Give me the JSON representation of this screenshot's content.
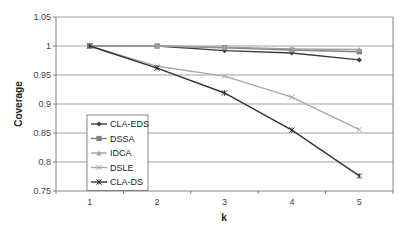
{
  "chart_data": {
    "type": "line",
    "title": "",
    "xlabel": "k",
    "ylabel": "Coverage",
    "categories": [
      "1",
      "2",
      "3",
      "4",
      "5"
    ],
    "x": [
      1,
      2,
      3,
      4,
      5
    ],
    "ylim": [
      0.75,
      1.05
    ],
    "yticks": [
      0.75,
      0.8,
      0.85,
      0.9,
      0.95,
      1,
      1.05
    ],
    "ytick_labels": [
      "0.75",
      "0.8",
      "0.85",
      "0.9",
      "0.95",
      "1",
      "1.05"
    ],
    "grid": true,
    "legend_position": "bottom-left",
    "series": [
      {
        "name": "CLA-EDS",
        "marker": "diamond",
        "color": "#3c3c3c",
        "values": [
          1.0,
          1.0,
          0.992,
          0.988,
          0.976
        ]
      },
      {
        "name": "DSSA",
        "marker": "square",
        "color": "#808080",
        "values": [
          1.0,
          1.0,
          0.997,
          0.993,
          0.99
        ]
      },
      {
        "name": "IDCA",
        "marker": "triangle",
        "color": "#a0a0a0",
        "values": [
          1.0,
          1.0,
          0.998,
          0.995,
          0.994
        ]
      },
      {
        "name": "DSLE",
        "marker": "x",
        "color": "#a8a8a8",
        "values": [
          1.0,
          0.965,
          0.948,
          0.912,
          0.856
        ]
      },
      {
        "name": "CLA-DS",
        "marker": "star",
        "color": "#333333",
        "values": [
          1.0,
          0.962,
          0.919,
          0.855,
          0.776
        ]
      }
    ]
  }
}
